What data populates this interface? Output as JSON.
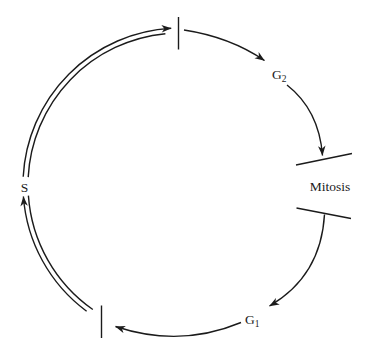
{
  "diagram": {
    "labels": {
      "g2": {
        "base": "G",
        "sub": "2"
      },
      "mitosis": "Mitosis",
      "g1": {
        "base": "G",
        "sub": "1"
      },
      "s": "S"
    },
    "colors": {
      "line": "#1b1b1b",
      "background": "#ffffff"
    }
  }
}
